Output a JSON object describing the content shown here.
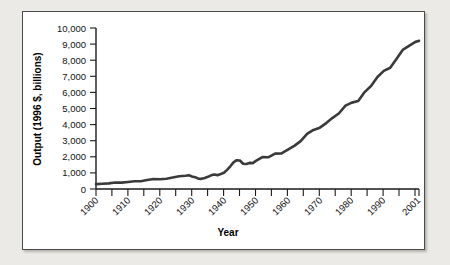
{
  "chart_data": {
    "type": "line",
    "title": "",
    "xlabel": "Year",
    "ylabel": "Output (1996 $, billions)",
    "xlim": [
      1900,
      2001
    ],
    "ylim": [
      0,
      10000
    ],
    "grid": false,
    "legend": null,
    "y_ticks": [
      0,
      1000,
      2000,
      3000,
      4000,
      5000,
      6000,
      7000,
      8000,
      9000,
      10000
    ],
    "y_tick_labels": [
      "0",
      "1,000",
      "2,000",
      "3,000",
      "4,000",
      "5,000",
      "6,000",
      "7,000",
      "8,000",
      "9,000",
      "10,000"
    ],
    "x_ticks": [
      1900,
      1910,
      1920,
      1930,
      1940,
      1950,
      1960,
      1970,
      1980,
      1990,
      2001
    ],
    "x_tick_labels": [
      "1900",
      "1910",
      "1920",
      "1930",
      "1940",
      "1950",
      "1960",
      "1970",
      "1980",
      "1990",
      "2001"
    ],
    "x_minor_tick_interval": 5,
    "series_name": "Real output",
    "line_color": "#3a3a3a",
    "x": [
      1900,
      1902,
      1904,
      1906,
      1908,
      1910,
      1912,
      1914,
      1916,
      1918,
      1920,
      1922,
      1924,
      1926,
      1928,
      1929,
      1930,
      1931,
      1932,
      1933,
      1934,
      1935,
      1936,
      1937,
      1938,
      1939,
      1940,
      1941,
      1942,
      1943,
      1944,
      1945,
      1946,
      1947,
      1948,
      1949,
      1950,
      1952,
      1954,
      1956,
      1958,
      1960,
      1962,
      1964,
      1966,
      1968,
      1970,
      1972,
      1974,
      1976,
      1978,
      1980,
      1982,
      1984,
      1986,
      1988,
      1990,
      1992,
      1994,
      1996,
      1998,
      2000,
      2001
    ],
    "y": [
      320,
      350,
      370,
      430,
      420,
      470,
      510,
      510,
      600,
      660,
      650,
      680,
      760,
      840,
      870,
      910,
      830,
      780,
      675,
      665,
      735,
      800,
      905,
      950,
      915,
      990,
      1075,
      1265,
      1500,
      1760,
      1900,
      1880,
      1670,
      1650,
      1720,
      1710,
      1860,
      2110,
      2100,
      2330,
      2350,
      2600,
      2850,
      3160,
      3640,
      3900,
      4050,
      4350,
      4700,
      5000,
      5500,
      5700,
      5800,
      6400,
      6800,
      7400,
      7800,
      8000,
      8600,
      9200,
      10100,
      11200,
      11300
    ],
    "y_plot": [
      300,
      330,
      350,
      400,
      395,
      440,
      480,
      480,
      560,
      620,
      610,
      640,
      715,
      790,
      820,
      860,
      780,
      735,
      640,
      630,
      690,
      755,
      850,
      895,
      860,
      930,
      1010,
      1190,
      1410,
      1655,
      1790,
      1770,
      1570,
      1555,
      1620,
      1610,
      1750,
      1985,
      1975,
      2195,
      2210,
      2450,
      2680,
      2975,
      3425,
      3670,
      3810,
      4095,
      4420,
      4705,
      5175,
      5365,
      5460,
      6020,
      6400,
      6960,
      7340,
      7530,
      8095,
      8660,
      8900,
      9150,
      9200
    ],
    "notes": {
      "great_depression_trough": {
        "year": 1933,
        "value": 630
      },
      "wwii_peak": {
        "year": 1944,
        "value": 1790
      },
      "endpoint": {
        "year": 2001,
        "value": 9200
      }
    }
  },
  "figure": {
    "background_color": "#eceae6",
    "panel_color": "#ffffff",
    "border_color": "#4a4a4a"
  }
}
